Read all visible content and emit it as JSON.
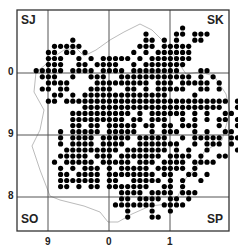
{
  "map": {
    "frame": {
      "x": 17,
      "y": 10,
      "w": 212,
      "h": 221
    },
    "grid_lines": {
      "x": [
        48,
        109,
        170
      ],
      "y": [
        73,
        135,
        197
      ]
    },
    "squares": [
      {
        "label": "SJ",
        "x": 21,
        "y": 13
      },
      {
        "label": "SK",
        "x": 207,
        "y": 13
      },
      {
        "label": "SO",
        "x": 21,
        "y": 212
      },
      {
        "label": "SP",
        "x": 207,
        "y": 212
      }
    ],
    "y_ticks": [
      {
        "label": "0",
        "y": 73
      },
      {
        "label": "9",
        "y": 135
      },
      {
        "label": "8",
        "y": 197
      }
    ],
    "x_ticks": [
      {
        "label": "9",
        "x": 48
      },
      {
        "label": "0",
        "x": 109
      },
      {
        "label": "1",
        "x": 170
      }
    ],
    "dot_grid": {
      "x0": 24,
      "y0": 28,
      "dx": 6.1,
      "dy": 6.1,
      "r": 2.6
    },
    "dots": [
      "..........................#...........",
      "....................#....##.###.......",
      "........#...........##.#.#..##........",
      ".....#####.........###.#####..........",
      "....##.##.#.......#.#.######..........",
      "....###..#.#.#####.#.#######..........",
      "....###..##.####..#.#######...........",
      "..#####.####.####.########...##.......",
      "...###..#..###..############.#.#......",
      "....####....#########.###.#####.#......",
      "...##.##...####..##.#.#####..##.#......",
      ".....##.#.##############....#.......#...",
      "....##.###########################.##..",
      "..........#######################..##..",
      "........##########.#.######.#.#..##.##.",
      "........#########.##.###..#.#.#.##.##.",
      "........##.##.#####.##.##.###...#..#.",
      "......#.#####.#####..#.###..#.#..##.",
      "......#.####.#####.#####..#.#####.##.",
      "......#.####.####..#######..#.###.#.",
      ".......#########.#######.#.#..#....#.",
      "......#####.###.#######.####.#..##.",
      ".....#.#####.#####.###.####.####..",
      "......#.#.###.#.#####.#####.#...",
      "......##.####.########.##..##.#.",
      "......#######.##..#####.#.#..#.",
      "......##.#.##.#######..##.#....",
      "................####.####.###..",
      "................##.####.##.#...",
      "...............#######.####....",
      ".................#...#..#......",
      ".................#...##........"
    ]
  }
}
